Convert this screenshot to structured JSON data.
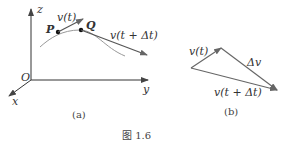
{
  "figure": {
    "caption": "图 1.6",
    "panel_a": {
      "label": "(a)",
      "axis_z": "z",
      "axis_y": "y",
      "axis_x": "x",
      "origin": "O",
      "point_p": "P",
      "point_q": "Q",
      "vec_t": "v(t)",
      "vec_t_dt": "v(t + Δt)"
    },
    "panel_b": {
      "label": "(b)",
      "vec_t": "v(t)",
      "delta_v": "Δv",
      "vec_t_dt": "v(t + Δt)"
    },
    "colors": {
      "axis": "#333333",
      "vector": "#555555",
      "curve": "#999999"
    }
  }
}
